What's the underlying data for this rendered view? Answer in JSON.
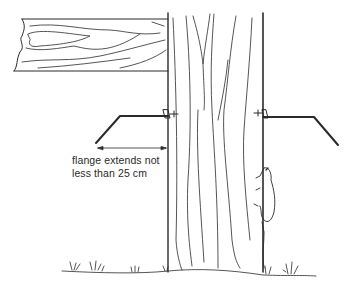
{
  "diagram": {
    "annotation": {
      "line1": "flange extends not",
      "line2": "less than 25 cm"
    },
    "elements": [
      "wooden-board",
      "tree-trunk",
      "left-flange",
      "right-flange",
      "dimension-arrow",
      "climbing-animal",
      "ground-grass"
    ],
    "colors": {
      "ink": "#2a2a2a",
      "background": "#ffffff"
    }
  }
}
